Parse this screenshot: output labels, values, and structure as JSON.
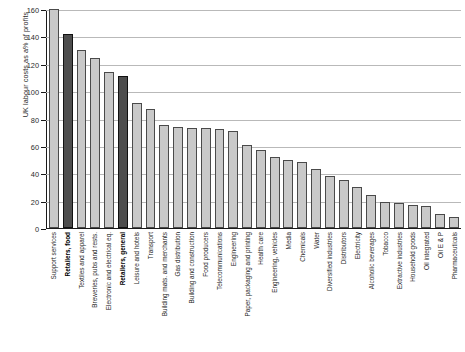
{
  "chart_data": {
    "type": "bar",
    "title": "",
    "subtitle": "",
    "xlabel": "",
    "ylabel": "UK labour costs as a% of profits",
    "ylim": [
      0,
      160
    ],
    "ytick_step": 20,
    "yticks": [
      0,
      20,
      40,
      60,
      80,
      100,
      120,
      140,
      160
    ],
    "ytick_labels": [
      "0",
      "20",
      "40",
      "60",
      "80",
      "100",
      "120",
      "140",
      "160"
    ],
    "grid": true,
    "legend": "none",
    "highlight_color": "#4d4d4d",
    "bar_color": "#c9c9c9",
    "bar_edge_color": "#4a4a4a",
    "categories": [
      "Support services",
      "Retailers, food",
      "Textiles and apparel",
      "Breweries, pubs and rests.",
      "Electronic and electrical eq.",
      "Retailers, general",
      "Leisure and hotels",
      "Transport",
      "Building mats. and merchants",
      "Gas distribution",
      "Building and construction",
      "Food producers",
      "Telecommunications",
      "Engineering",
      "Paper, packaging and printing",
      "Health care",
      "Engineering, vehicles",
      "Media",
      "Chemicals",
      "Water",
      "Diversified industries",
      "Distributors",
      "Electricity",
      "Alcoholic beverages",
      "Tobacco",
      "Extractive industries",
      "Household goods",
      "Oil integrated",
      "Oil E & P",
      "Pharmaceuticals"
    ],
    "values": [
      161,
      142,
      130,
      124,
      114,
      111,
      91,
      87,
      75,
      74,
      73,
      73,
      72,
      71,
      61,
      57,
      52,
      50,
      48,
      43,
      38,
      35,
      30,
      24,
      19,
      18,
      17,
      16,
      10,
      8
    ],
    "highlight_indices": [
      1,
      5
    ]
  }
}
